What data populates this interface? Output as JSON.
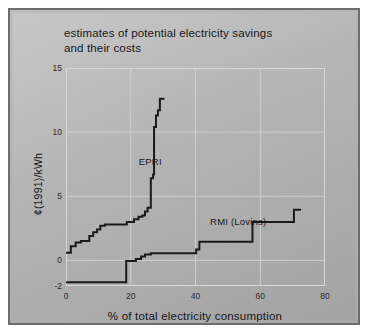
{
  "figure": {
    "panel_bg": "#b5b5b5",
    "frame_color": "#6d6d6d",
    "ink_color": "#1a1a1a",
    "grid_color": "#cfcfcf"
  },
  "chart_data": {
    "type": "line",
    "title": "estimates of potential electricity savings and their costs",
    "title_lines": [
      "estimates of potential electricity savings",
      "and their costs"
    ],
    "xlabel": "% of total electricity consumption",
    "ylabel": "¢(1991)/kWh",
    "xlim": [
      0,
      80
    ],
    "ylim": [
      -2,
      15
    ],
    "xticks": [
      0,
      20,
      40,
      60,
      80
    ],
    "xtick_labels": [
      "0",
      "20",
      "40",
      "60",
      "80"
    ],
    "yticks": [
      -2,
      0,
      5,
      10,
      15
    ],
    "ytick_labels": [
      "-2",
      "0",
      "5",
      "10",
      "15"
    ],
    "grid": true,
    "grid_x": [
      20,
      40,
      60
    ],
    "grid_y": [
      0,
      5,
      10
    ],
    "legend": "inline-annotations",
    "annotations": [
      {
        "text": "EPRI",
        "x": 22.5,
        "y": 7.6
      },
      {
        "text": "RMI (Lovins)",
        "x": 44.5,
        "y": 2.9
      }
    ],
    "series": [
      {
        "name": "EPRI",
        "style": "step",
        "color": "#1a1a1a",
        "points": [
          [
            0.0,
            0.6
          ],
          [
            1.5,
            0.6
          ],
          [
            1.5,
            1.1
          ],
          [
            3.0,
            1.1
          ],
          [
            3.0,
            1.4
          ],
          [
            4.6,
            1.4
          ],
          [
            4.6,
            1.5
          ],
          [
            7.2,
            1.5
          ],
          [
            7.2,
            1.9
          ],
          [
            8.4,
            1.9
          ],
          [
            8.4,
            2.2
          ],
          [
            9.6,
            2.2
          ],
          [
            9.6,
            2.4
          ],
          [
            10.6,
            2.4
          ],
          [
            10.6,
            2.7
          ],
          [
            12.0,
            2.7
          ],
          [
            12.0,
            2.8
          ],
          [
            18.8,
            2.8
          ],
          [
            18.8,
            3.0
          ],
          [
            21.0,
            3.0
          ],
          [
            21.0,
            3.2
          ],
          [
            22.4,
            3.2
          ],
          [
            22.4,
            3.4
          ],
          [
            23.6,
            3.4
          ],
          [
            23.6,
            3.5
          ],
          [
            24.4,
            3.5
          ],
          [
            24.4,
            3.8
          ],
          [
            25.2,
            3.8
          ],
          [
            25.2,
            4.1
          ],
          [
            26.2,
            4.1
          ],
          [
            26.2,
            6.4
          ],
          [
            26.9,
            6.4
          ],
          [
            26.9,
            6.7
          ],
          [
            27.2,
            6.7
          ],
          [
            27.2,
            10.4
          ],
          [
            27.8,
            10.4
          ],
          [
            27.8,
            11.3
          ],
          [
            28.4,
            11.3
          ],
          [
            28.4,
            11.7
          ],
          [
            29.0,
            11.7
          ],
          [
            29.0,
            12.6
          ],
          [
            30.4,
            12.6
          ]
        ]
      },
      {
        "name": "RMI (Lovins)",
        "style": "step",
        "color": "#1a1a1a",
        "points": [
          [
            0.0,
            -1.7
          ],
          [
            18.6,
            -1.7
          ],
          [
            18.6,
            -0.05
          ],
          [
            21.6,
            -0.05
          ],
          [
            21.6,
            0.1
          ],
          [
            23.2,
            0.1
          ],
          [
            23.2,
            0.3
          ],
          [
            24.4,
            0.3
          ],
          [
            24.4,
            0.45
          ],
          [
            26.2,
            0.45
          ],
          [
            26.2,
            0.55
          ],
          [
            40.2,
            0.55
          ],
          [
            40.2,
            0.85
          ],
          [
            41.2,
            0.85
          ],
          [
            41.2,
            1.45
          ],
          [
            57.6,
            1.45
          ],
          [
            57.6,
            3.0
          ],
          [
            70.4,
            3.0
          ],
          [
            70.4,
            3.95
          ],
          [
            72.6,
            3.95
          ]
        ]
      }
    ]
  }
}
